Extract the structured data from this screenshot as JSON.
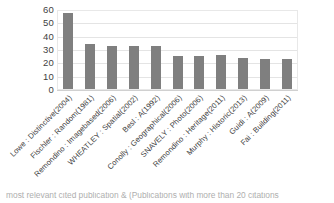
{
  "chart_data": {
    "type": "bar",
    "title": "",
    "xlabel": "",
    "ylabel": "",
    "ylim": [
      0,
      60
    ],
    "yticks": [
      0,
      10,
      20,
      30,
      40,
      50,
      60
    ],
    "grid": true,
    "legend": "none",
    "orientation": "vertical",
    "bar_color": "#7f7f7f",
    "xtick_rotation": -45,
    "categories": [
      "Lowe : Distinctive(2004)",
      "Fischler : Random(1981)",
      "Remondino : Imagebased(2006)",
      "WHEATLEY : Spatial(2002)",
      "Besl : A(1992)",
      "Conolly : Geographical(2006)",
      "SNAVELY : Photo(2006)",
      "Remondino : Heritage(2011)",
      "Murphy : Historic(2013)",
      "Guidi : A(2009)",
      "Fai : Building(2011)"
    ],
    "values": [
      57,
      34,
      32,
      32,
      32,
      25,
      25,
      25.5,
      23,
      22.5,
      22.5
    ]
  },
  "caption": {
    "text": "most relevant cited publication & (Publications with more than 20 citations"
  }
}
